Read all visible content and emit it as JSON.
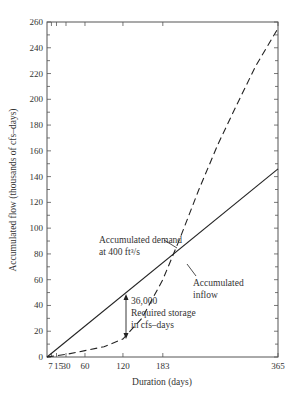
{
  "chart_data": {
    "type": "line",
    "title": "",
    "xlabel": "Duration (days)",
    "ylabel": "Accumulated flow (thousands of cfs–days)",
    "xlim": [
      0,
      365
    ],
    "ylim": [
      0,
      260
    ],
    "grid": false,
    "x_ticks": [
      7,
      15,
      30,
      60,
      120,
      183,
      365
    ],
    "x_tick_labels": [
      "7",
      "15",
      "30",
      "60",
      "120",
      "183",
      "365"
    ],
    "y_ticks": [
      0,
      20,
      40,
      60,
      80,
      100,
      120,
      140,
      160,
      180,
      200,
      220,
      240,
      260
    ],
    "y_tick_labels": [
      "0",
      "20",
      "40",
      "60",
      "80",
      "100",
      "120",
      "140",
      "160",
      "180",
      "200",
      "220",
      "240",
      "260"
    ],
    "series": [
      {
        "name": "Accumulated demand at 400 ft³/s",
        "style": "solid",
        "x": [
          0,
          365
        ],
        "y": [
          0,
          146
        ]
      },
      {
        "name": "Accumulated inflow",
        "style": "dashed",
        "x": [
          0,
          7,
          15,
          30,
          60,
          90,
          120,
          150,
          183,
          210,
          240,
          270,
          300,
          330,
          365
        ],
        "y": [
          0,
          0.5,
          1,
          2,
          5,
          8,
          14,
          30,
          60,
          92,
          130,
          165,
          196,
          226,
          255
        ]
      }
    ],
    "annotations": [
      {
        "text_lines": [
          "Accumulated demand",
          "at 400 ft³/s"
        ],
        "points_to": "demand line"
      },
      {
        "text_lines": [
          "Accumulated",
          "inflow"
        ],
        "points_to": "inflow curve"
      },
      {
        "text_lines": [
          "36,000",
          "Required storage",
          "in cfs–days"
        ],
        "arrow_at_x": 120,
        "arrow_from_y": 48,
        "arrow_to_y": 14
      }
    ]
  },
  "labels": {
    "xlabel": "Duration (days)",
    "ylabel": "Accumulated flow (thousands of cfs–days)",
    "demand_line1": "Accumulated demand",
    "demand_line2": "at 400 ft³/s",
    "inflow_line1": "Accumulated",
    "inflow_line2": "inflow",
    "storage_value": "36,000",
    "storage_line1": "Required storage",
    "storage_line2": "in cfs–days"
  },
  "style": {
    "line_color": "#222222",
    "frame_color": "#555555"
  }
}
